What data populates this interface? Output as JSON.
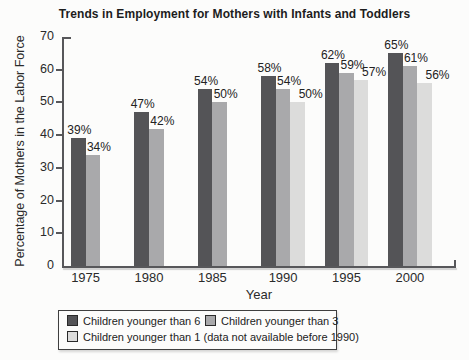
{
  "title": "Trends in Employment for Mothers with Infants and Toddlers",
  "chart_data": {
    "type": "bar",
    "title": "Trends in Employment for Mothers with Infants and Toddlers",
    "categories": [
      "1975",
      "1980",
      "1985",
      "1990",
      "1995",
      "2000"
    ],
    "series": [
      {
        "name": "Children younger than 6",
        "color": "#545457",
        "values": [
          39,
          47,
          54,
          58,
          62,
          65
        ]
      },
      {
        "name": "Children younger than 3",
        "color": "#a9a9ab",
        "values": [
          34,
          42,
          50,
          54,
          59,
          61
        ]
      },
      {
        "name": "Children younger than 1 (data not available before 1990)",
        "color": "#dcdcdb",
        "values": [
          null,
          null,
          null,
          50,
          57,
          56
        ]
      }
    ],
    "data_label_format": "{value}%",
    "data_labels": [
      "39%",
      "34%",
      "47%",
      "42%",
      "54%",
      "50%",
      "58%",
      "54%",
      "50%",
      "62%",
      "59%",
      "57%",
      "65%",
      "61%",
      "56%"
    ],
    "xlabel": "Year",
    "ylabel": "Percentage of Mothers in the Labor Force",
    "ylim": [
      0,
      70
    ],
    "yticks": [
      0,
      10,
      20,
      30,
      40,
      50,
      60,
      70
    ],
    "grid": false,
    "legend_position": "bottom"
  },
  "colors": {
    "axis": "#57575a",
    "text": "#2a2a2a",
    "background": "#fcfcfb",
    "legend_border": "#3f3f3f"
  }
}
